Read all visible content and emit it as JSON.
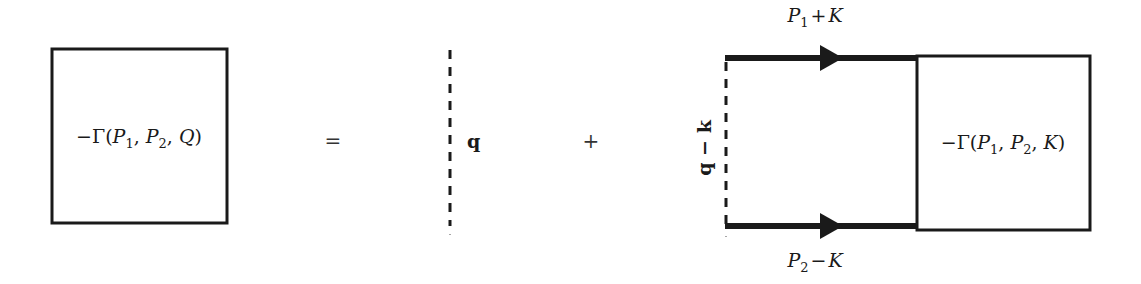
{
  "diagram": {
    "lhs": {
      "box_label": "−Γ(P₁, P₂, Q)",
      "minus": "−",
      "gamma": "Γ",
      "args": [
        "P",
        "1",
        "P",
        "2",
        "Q"
      ]
    },
    "equals": "=",
    "term1": {
      "line_type": "dashed",
      "label": "q"
    },
    "plus": "+",
    "term2": {
      "top_line_label": "P₁ + K",
      "top_label_parts": {
        "p": "P",
        "sub": "1",
        "op": "+",
        "k": "K"
      },
      "bottom_line_label": "P₂ − K",
      "bottom_label_parts": {
        "p": "P",
        "sub": "2",
        "op": "−",
        "k": "K"
      },
      "dashed_label": "q − k",
      "box_label": "−Γ(P₁, P₂, K)",
      "box_args": [
        "P",
        "1",
        "P",
        "2",
        "K"
      ]
    },
    "colors": {
      "stroke": "#1a1a1a",
      "background": "#ffffff"
    }
  }
}
